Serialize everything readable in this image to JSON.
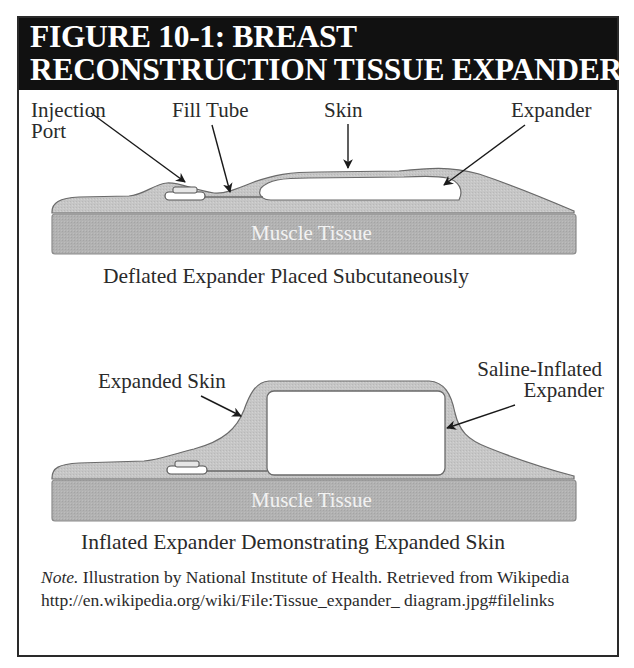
{
  "figure": {
    "title_line1": "FIGURE 10-1: BREAST",
    "title_line2": "RECONSTRUCTION TISSUE EXPANDER",
    "colors": {
      "header_bg": "#111111",
      "header_text": "#ffffff",
      "muscle": "#b3b3b3",
      "skin": "#c4c4c4",
      "outline": "#666666",
      "expander": "#ffffff"
    }
  },
  "diagram_deflated": {
    "labels": {
      "injection_port_line1": "Injection",
      "injection_port_line2": "Port",
      "fill_tube": "Fill Tube",
      "skin": "Skin",
      "expander": "Expander"
    },
    "muscle_label": "Muscle Tissue",
    "caption": "Deflated Expander Placed Subcutaneously"
  },
  "diagram_inflated": {
    "labels": {
      "expanded_skin": "Expanded Skin",
      "saline_line1": "Saline-Inflated",
      "saline_line2": "Expander"
    },
    "muscle_label": "Muscle Tissue",
    "caption": "Inflated Expander Demonstrating Expanded Skin"
  },
  "note": {
    "prefix": "Note.",
    "text": " Illustration by National Institute of Health. Retrieved from Wikipedia http://en.wikipedia.org/wiki/File:Tissue_expander_ diagram.jpg#filelinks"
  }
}
